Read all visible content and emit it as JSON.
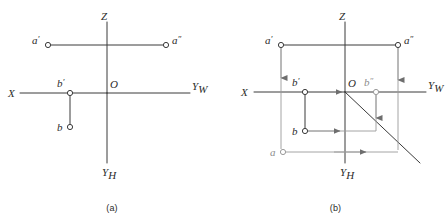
{
  "figure": {
    "type": "orthographic-projection-diagram",
    "stroke_color": "#3a3a3a",
    "faint_stroke_color": "#9a9a9a",
    "background": "#ffffff",
    "panels": [
      {
        "id": "a",
        "caption": "(a)",
        "axes": {
          "z_label": "Z",
          "x_label": "X",
          "yw_label": "Y",
          "yw_sub": "W",
          "yh_label": "Y",
          "yh_sub": "H",
          "origin_label": "O"
        },
        "points": [
          {
            "name": "a-prime",
            "label": "a",
            "prime": "′",
            "x": 48,
            "y": 45
          },
          {
            "name": "a-double-prime",
            "label": "a",
            "prime": "″",
            "x": 166,
            "y": 45
          },
          {
            "name": "b-prime",
            "label": "b",
            "prime": "′",
            "x": 70,
            "y": 93
          },
          {
            "name": "b",
            "label": "b",
            "prime": "",
            "x": 70,
            "y": 127
          }
        ]
      },
      {
        "id": "b",
        "caption": "(b)",
        "axes": {
          "z_label": "Z",
          "x_label": "X",
          "yw_label": "Y",
          "yw_sub": "W",
          "yh_label": "Y",
          "yh_sub": "H",
          "origin_label": "O"
        },
        "points": [
          {
            "name": "a-prime",
            "label": "a",
            "prime": "′",
            "x": 57,
            "y": 45
          },
          {
            "name": "a-double-prime",
            "label": "a",
            "prime": "″",
            "x": 174,
            "y": 45
          },
          {
            "name": "b-prime",
            "label": "b",
            "prime": "′",
            "x": 81,
            "y": 92
          },
          {
            "name": "b-double-prime",
            "label": "b",
            "prime": "″",
            "x": 152,
            "y": 92
          },
          {
            "name": "b",
            "label": "b",
            "prime": "",
            "x": 81,
            "y": 131
          },
          {
            "name": "a",
            "label": "a",
            "prime": "",
            "x": 59,
            "y": 152
          }
        ],
        "miter_line": {
          "name": "forty-five-degree-line",
          "from_x": 121,
          "from_y": 92,
          "to_x": 196,
          "to_y": 163
        }
      }
    ]
  }
}
